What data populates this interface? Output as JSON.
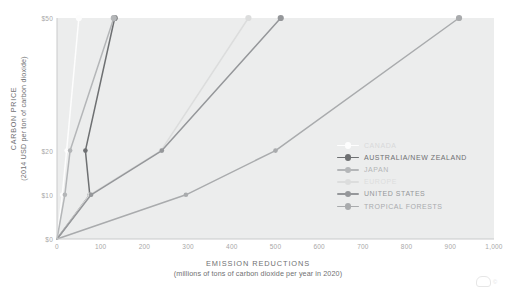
{
  "chart_data": {
    "type": "line",
    "title": "",
    "xlabel": "EMISSION REDUCTIONS",
    "xlabel_sub": "(millions of tons of carbon dioxide per year in 2020)",
    "ylabel": "CARBON PRICE",
    "ylabel_sub": "(2014 USD per ton of carbon dioxide)",
    "xlim": [
      0,
      1000
    ],
    "ylim": [
      0,
      50
    ],
    "grid": false,
    "legend_position": "inside-right",
    "xticks": [
      0,
      100,
      200,
      300,
      400,
      500,
      600,
      700,
      800,
      900,
      1000
    ],
    "xtick_labels": [
      "0",
      "100",
      "200",
      "300",
      "400",
      "500",
      "600",
      "700",
      "800",
      "900",
      "1,000"
    ],
    "yticks": [
      0,
      10,
      20,
      50
    ],
    "ytick_labels": [
      "$0",
      "$10",
      "$20",
      "$50"
    ],
    "series": [
      {
        "name": "CANADA",
        "color": "#fdfdfd",
        "label_color": "#d8d9da",
        "points": [
          {
            "x": 0,
            "y": 0
          },
          {
            "x": 12,
            "y": 10
          },
          {
            "x": 22,
            "y": 20
          },
          {
            "x": 50,
            "y": 50
          }
        ]
      },
      {
        "name": "AUSTRALIA/NEW ZEALAND",
        "color": "#6e7072",
        "label_color": "#6e7072",
        "points": [
          {
            "x": 0,
            "y": 0
          },
          {
            "x": 75,
            "y": 10
          },
          {
            "x": 65,
            "y": 20
          },
          {
            "x": 132,
            "y": 50
          }
        ]
      },
      {
        "name": "JAPAN",
        "color": "#b4b6b8",
        "label_color": "#b4b6b8",
        "points": [
          {
            "x": 0,
            "y": 0
          },
          {
            "x": 18,
            "y": 10
          },
          {
            "x": 30,
            "y": 20
          },
          {
            "x": 130,
            "y": 50
          }
        ]
      },
      {
        "name": "EUROPE",
        "color": "#dcdddd",
        "label_color": "#dcdddd",
        "points": [
          {
            "x": 0,
            "y": 0
          },
          {
            "x": 75,
            "y": 10
          },
          {
            "x": 238,
            "y": 20
          },
          {
            "x": 438,
            "y": 50
          }
        ]
      },
      {
        "name": "UNITED STATES",
        "color": "#95979a",
        "label_color": "#95979a",
        "points": [
          {
            "x": 0,
            "y": 0
          },
          {
            "x": 78,
            "y": 10
          },
          {
            "x": 240,
            "y": 20
          },
          {
            "x": 512,
            "y": 50
          }
        ]
      },
      {
        "name": "TROPICAL FORESTS",
        "color": "#a9abad",
        "label_color": "#a9abad",
        "points": [
          {
            "x": 0,
            "y": 0
          },
          {
            "x": 295,
            "y": 10
          },
          {
            "x": 500,
            "y": 20
          },
          {
            "x": 920,
            "y": 50
          }
        ]
      }
    ]
  },
  "watermark": {
    "text": "©"
  }
}
